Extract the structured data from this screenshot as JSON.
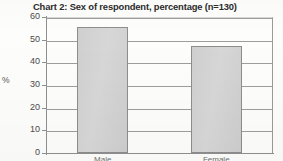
{
  "chart_data": {
    "type": "bar",
    "title": "Chart 2: Sex of respondent, percentage (n=130)",
    "xlabel": "",
    "ylabel": "%",
    "categories": [
      "Male",
      "Female"
    ],
    "values": [
      55.5,
      47
    ],
    "ylim": [
      0,
      60
    ],
    "yticks": [
      0,
      10,
      20,
      30,
      40,
      50,
      60
    ],
    "ytick_labels": [
      "0",
      "10",
      "20",
      "30",
      "40",
      "50",
      "60"
    ],
    "grid": true,
    "legend": "none",
    "bar_color": "#d2d2d2",
    "bar_edge_color": "#8d8d8d",
    "axis_color": "#8f8f8f",
    "gridline_color": "#9d9d9d",
    "title_color": "#2b2b2b",
    "sample_size": "n=130",
    "note": "Category labels below the axis are cropped off the bottom edge of the screenshot"
  }
}
